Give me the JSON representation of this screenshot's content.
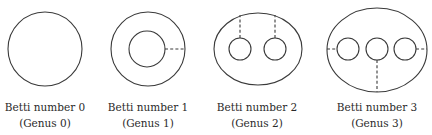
{
  "figure": {
    "panels": [
      {
        "title": "Betti number 0",
        "subtitle": "(Genus 0)",
        "shape": "circle",
        "holes": 0,
        "cuts": 0
      },
      {
        "title": "Betti number 1",
        "subtitle": "(Genus 1)",
        "shape": "annulus",
        "holes": 1,
        "cuts": 1
      },
      {
        "title": "Betti number 2",
        "subtitle": "(Genus 2)",
        "shape": "ellipse with two holes",
        "holes": 2,
        "cuts": 2
      },
      {
        "title": "Betti number 3",
        "subtitle": "(Genus 3)",
        "shape": "ellipse with three holes",
        "holes": 3,
        "cuts": 3
      }
    ],
    "colors": {
      "stroke": "#3a3a3a",
      "text": "#2a2a2a",
      "background": "#ffffff"
    }
  }
}
